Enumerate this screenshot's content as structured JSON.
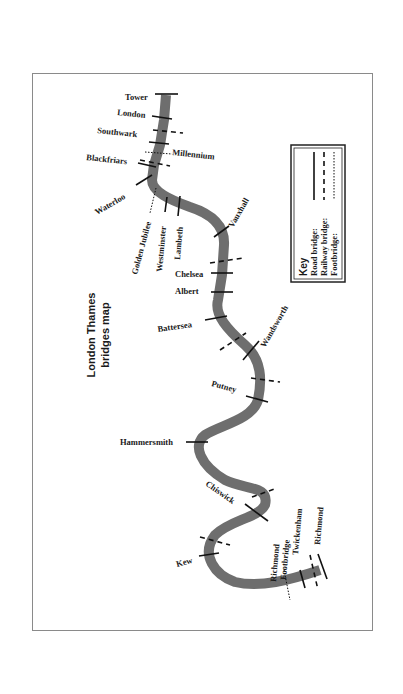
{
  "map": {
    "title_line1": "London Thames",
    "title_line2": "bridges map",
    "river_color": "#6e6e6e",
    "bridges": [
      {
        "name": "Tower",
        "type": "road"
      },
      {
        "name": "London",
        "type": "road"
      },
      {
        "name": "Southwark",
        "type": "road"
      },
      {
        "name": "Millennium",
        "type": "footbridge"
      },
      {
        "name": "Blackfriars",
        "type": "road"
      },
      {
        "name": "Waterloo",
        "type": "road"
      },
      {
        "name": "Golden Jubilee",
        "type": "footbridge"
      },
      {
        "name": "Westminster",
        "type": "road"
      },
      {
        "name": "Lambeth",
        "type": "road"
      },
      {
        "name": "Vauxhall",
        "type": "road"
      },
      {
        "name": "Chelsea",
        "type": "road"
      },
      {
        "name": "Albert",
        "type": "road"
      },
      {
        "name": "Battersea",
        "type": "road"
      },
      {
        "name": "Wandsworth",
        "type": "road"
      },
      {
        "name": "Putney",
        "type": "road"
      },
      {
        "name": "Hammersmith",
        "type": "road"
      },
      {
        "name": "Chiswick",
        "type": "road"
      },
      {
        "name": "Kew",
        "type": "road"
      },
      {
        "name": "Richmond Footbridge",
        "type": "footbridge"
      },
      {
        "name": "Twickenham",
        "type": "road"
      },
      {
        "name": "Richmond",
        "type": "road"
      }
    ],
    "labels": {
      "tower": "Tower",
      "london": "London",
      "southwark": "Southwark",
      "millennium": "Millennium",
      "blackfriars": "Blackfriars",
      "waterloo": "Waterloo",
      "golden_jubilee": "Golden Jubilee",
      "westminster": "Westminster",
      "lambeth": "Lambeth",
      "vauxhall": "Vauxhall",
      "chelsea": "Chelsea",
      "albert": "Albert",
      "battersea": "Battersea",
      "wandsworth": "Wandsworth",
      "putney": "Putney",
      "hammersmith": "Hammersmith",
      "chiswick": "Chiswick",
      "kew": "Kew",
      "richmond_footbridge_1": "Richmond",
      "richmond_footbridge_2": "Footbridge",
      "twickenham": "Twickenham",
      "richmond": "Richmond"
    },
    "key": {
      "title": "Key",
      "road": "Road bridge:",
      "railway": "Railway bridge:",
      "footbridge": "Footbridge:"
    }
  }
}
